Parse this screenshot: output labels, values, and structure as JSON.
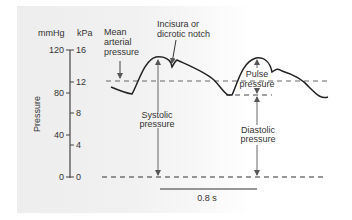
{
  "axis": {
    "unit_left": "mmHg",
    "unit_right": "kPa",
    "title": "Pressure",
    "ticks_mmHg": [
      "120",
      "80",
      "40",
      "0"
    ],
    "ticks_kPa": [
      "16",
      "12",
      "8",
      "4",
      "0"
    ]
  },
  "annotations": {
    "mean_arterial_line1": "Mean",
    "mean_arterial_line2": "arterial",
    "mean_arterial_line3": "pressure",
    "incisura_line1": "Incisura or",
    "incisura_line2": "dicrotic notch",
    "systolic_line1": "Systolic",
    "systolic_line2": "pressure",
    "pulse_line1": "Pulse",
    "pulse_line2": "pressure",
    "diastolic_line1": "Diastolic",
    "diastolic_line2": "pressure"
  },
  "scale_bar": {
    "label": "0.8 s"
  },
  "colors": {
    "line": "#222222",
    "dashed": "#555555",
    "arrow": "#555555",
    "text": "#333333"
  }
}
